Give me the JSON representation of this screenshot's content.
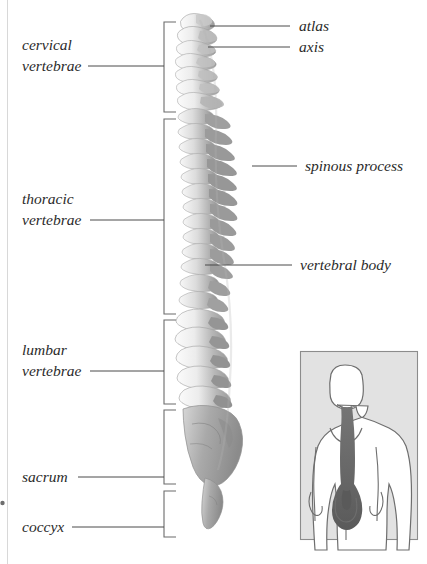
{
  "figure": {
    "background_color": "#ffffff",
    "ink_color": "#2b2b2b",
    "leader_color": "#4a4a4a"
  },
  "left_labels": [
    {
      "id": "cervical",
      "line1": "cervical",
      "line2": "vertebrae"
    },
    {
      "id": "thoracic",
      "line1": "thoracic",
      "line2": "vertebrae"
    },
    {
      "id": "lumbar",
      "line1": "lumbar",
      "line2": "vertebrae"
    },
    {
      "id": "sacrum",
      "line1": "sacrum",
      "line2": ""
    },
    {
      "id": "coccyx",
      "line1": "coccyx",
      "line2": ""
    }
  ],
  "right_labels": [
    {
      "id": "atlas",
      "text": "atlas"
    },
    {
      "id": "axis",
      "text": "axis"
    },
    {
      "id": "spinous-process",
      "text": "spinous process"
    },
    {
      "id": "vertebral-body",
      "text": "vertebral body"
    }
  ],
  "inset": {
    "id": "body-orientation-inset",
    "description": "posterior-view-human-figure-with-spine-highlighted",
    "panel_color": "#e2e2e2",
    "spine_color": "#6d6d6d",
    "figure_color": "#ffffff"
  },
  "regions": [
    {
      "id": "cervical",
      "vertebra_count": 7
    },
    {
      "id": "thoracic",
      "vertebra_count": 12
    },
    {
      "id": "lumbar",
      "vertebra_count": 5
    },
    {
      "id": "sacrum",
      "vertebra_count": 5
    },
    {
      "id": "coccyx",
      "vertebra_count": 4
    }
  ]
}
